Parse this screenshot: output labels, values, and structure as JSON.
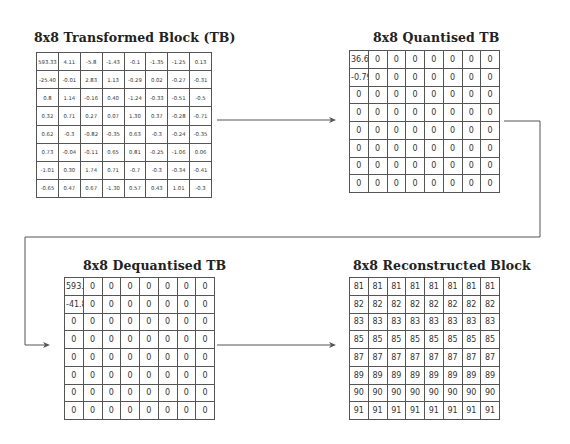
{
  "panels": {
    "transformed": {
      "title": "8x8 Transformed Block (TB)",
      "rows": [
        [
          "593.33",
          "4.11",
          "-5.8",
          "-1.43",
          "-0.1",
          "-1.35",
          "-1.25",
          "0.13"
        ],
        [
          "-25.40",
          "-0.01",
          "2.83",
          "1.13",
          "-0.29",
          "0.02",
          "-0.27",
          "-0.31"
        ],
        [
          "0.8",
          "1.14",
          "-0.16",
          "0.40",
          "-1.24",
          "-0.33",
          "-0.51",
          "-0.5"
        ],
        [
          "0.32",
          "0.71",
          "0.27",
          "0.07",
          "1.30",
          "0.37",
          "-0.28",
          "-0.71"
        ],
        [
          "0.62",
          "-0.3",
          "-0.82",
          "-0.35",
          "0.63",
          "-0.3",
          "-0.24",
          "-0.35"
        ],
        [
          "0.73",
          "-0.04",
          "-0.11",
          "0.65",
          "0.81",
          "-0.25",
          "-1.06",
          "0.06"
        ],
        [
          "-1.01",
          "0.30",
          "1.74",
          "0.71",
          "-0.7",
          "-0.3",
          "-0.34",
          "-0.41"
        ],
        [
          "-0.65",
          "0.47",
          "0.67",
          "-1.30",
          "0.57",
          "0.43",
          "1.01",
          "-0.3"
        ]
      ]
    },
    "quantised": {
      "title": "8x8 Quantised TB",
      "rows": [
        [
          "36.67",
          "0",
          "0",
          "0",
          "0",
          "0",
          "0",
          "0"
        ],
        [
          "-0.79",
          "0",
          "0",
          "0",
          "0",
          "0",
          "0",
          "0"
        ],
        [
          "0",
          "0",
          "0",
          "0",
          "0",
          "0",
          "0",
          "0"
        ],
        [
          "0",
          "0",
          "0",
          "0",
          "0",
          "0",
          "0",
          "0"
        ],
        [
          "0",
          "0",
          "0",
          "0",
          "0",
          "0",
          "0",
          "0"
        ],
        [
          "0",
          "0",
          "0",
          "0",
          "0",
          "0",
          "0",
          "0"
        ],
        [
          "0",
          "0",
          "0",
          "0",
          "0",
          "0",
          "0",
          "0"
        ],
        [
          "0",
          "0",
          "0",
          "0",
          "0",
          "0",
          "0",
          "0"
        ]
      ]
    },
    "dequantised": {
      "title": "8x8 Dequantised TB",
      "rows": [
        [
          "593.3",
          "0",
          "0",
          "0",
          "0",
          "0",
          "0",
          "0"
        ],
        [
          "-41.8",
          "0",
          "0",
          "0",
          "0",
          "0",
          "0",
          "0"
        ],
        [
          "0",
          "0",
          "0",
          "0",
          "0",
          "0",
          "0",
          "0"
        ],
        [
          "0",
          "0",
          "0",
          "0",
          "0",
          "0",
          "0",
          "0"
        ],
        [
          "0",
          "0",
          "0",
          "0",
          "0",
          "0",
          "0",
          "0"
        ],
        [
          "0",
          "0",
          "0",
          "0",
          "0",
          "0",
          "0",
          "0"
        ],
        [
          "0",
          "0",
          "0",
          "0",
          "0",
          "0",
          "0",
          "0"
        ],
        [
          "0",
          "0",
          "0",
          "0",
          "0",
          "0",
          "0",
          "0"
        ]
      ]
    },
    "reconstructed": {
      "title": "8x8 Reconstructed Block",
      "rows": [
        [
          "81",
          "81",
          "81",
          "81",
          "81",
          "81",
          "81",
          "81"
        ],
        [
          "82",
          "82",
          "82",
          "82",
          "82",
          "82",
          "82",
          "82"
        ],
        [
          "83",
          "83",
          "83",
          "83",
          "83",
          "83",
          "83",
          "83"
        ],
        [
          "85",
          "85",
          "85",
          "85",
          "85",
          "85",
          "85",
          "85"
        ],
        [
          "87",
          "87",
          "87",
          "87",
          "87",
          "87",
          "87",
          "87"
        ],
        [
          "89",
          "89",
          "89",
          "89",
          "89",
          "89",
          "89",
          "89"
        ],
        [
          "90",
          "90",
          "90",
          "90",
          "90",
          "90",
          "90",
          "90"
        ],
        [
          "91",
          "91",
          "91",
          "91",
          "91",
          "91",
          "91",
          "91"
        ]
      ]
    }
  },
  "connectors": {
    "color": "#555555",
    "flow": [
      "transformed",
      "quantised",
      "dequantised",
      "reconstructed"
    ]
  }
}
